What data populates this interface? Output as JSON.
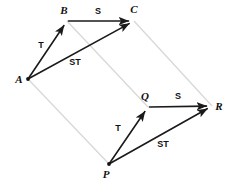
{
  "figure": {
    "title": "",
    "background_color": "#ffffff",
    "solid_edge_color": "#1a1a1a",
    "guide_edge_color": "#d8d8d8",
    "label_color": "#111111"
  },
  "vertices": [
    {
      "id": "A",
      "label": "A",
      "x": 28,
      "y": 79,
      "label_x": 19,
      "label_y": 83
    },
    {
      "id": "B",
      "label": "B",
      "x": 67,
      "y": 21,
      "label_x": 64,
      "label_y": 14
    },
    {
      "id": "C",
      "label": "C",
      "x": 134,
      "y": 21,
      "label_x": 134,
      "label_y": 13
    },
    {
      "id": "P",
      "label": "P",
      "x": 109,
      "y": 164,
      "label_x": 106,
      "label_y": 178
    },
    {
      "id": "Q",
      "label": "Q",
      "x": 148,
      "y": 107,
      "label_x": 145,
      "label_y": 100
    },
    {
      "id": "R",
      "label": "R",
      "x": 212,
      "y": 106,
      "label_x": 219,
      "label_y": 110
    }
  ],
  "arrows": [
    {
      "id": "A-B",
      "from": "A",
      "to": "B",
      "label": "T",
      "label_x": 41,
      "label_y": 48
    },
    {
      "id": "B-C",
      "from": "B",
      "to": "C",
      "label": "S",
      "label_x": 98,
      "label_y": 14
    },
    {
      "id": "A-C",
      "from": "A",
      "to": "C",
      "label": "ST",
      "label_x": 75,
      "label_y": 65
    },
    {
      "id": "P-Q",
      "from": "P",
      "to": "Q",
      "label": "T",
      "label_x": 118,
      "label_y": 131
    },
    {
      "id": "Q-R",
      "from": "Q",
      "to": "R",
      "label": "S",
      "label_x": 178,
      "label_y": 99
    },
    {
      "id": "P-R",
      "from": "P",
      "to": "R",
      "label": "ST",
      "label_x": 163,
      "label_y": 147
    }
  ],
  "guides": [
    {
      "id": "A-P",
      "from": "A",
      "to": "P"
    },
    {
      "id": "B-Q",
      "from": "B",
      "to": "Q"
    },
    {
      "id": "C-R",
      "from": "C",
      "to": "R"
    }
  ]
}
